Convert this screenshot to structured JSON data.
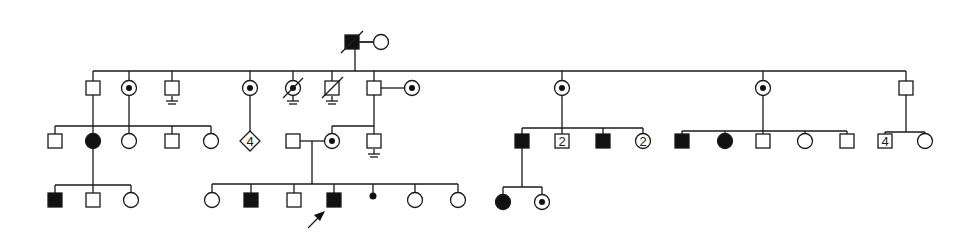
{
  "figure": {
    "type": "pedigree",
    "legend_colors": {
      "line": "#1a1a1a",
      "affected": "#111111",
      "unaffected": "#ffffff"
    },
    "proband_marker": "arrow"
  },
  "generations": [
    {
      "label": "I",
      "individuals": [
        {
          "id": "I-1",
          "sex": "male",
          "status": "affected",
          "deceased": true,
          "x": 352,
          "y": 42
        },
        {
          "id": "I-2",
          "sex": "female",
          "status": "unaffected",
          "x": 381,
          "y": 42
        }
      ]
    },
    {
      "label": "II",
      "individuals": [
        {
          "id": "II-1",
          "sex": "male",
          "status": "unaffected",
          "x": 93,
          "y": 88
        },
        {
          "id": "II-2",
          "sex": "female",
          "status": "carrier",
          "x": 129,
          "y": 88
        },
        {
          "id": "II-3",
          "sex": "male",
          "status": "unaffected",
          "no_offspring": true,
          "x": 172,
          "y": 88
        },
        {
          "id": "II-4",
          "sex": "female",
          "status": "carrier",
          "x": 250,
          "y": 88
        },
        {
          "id": "II-5",
          "sex": "female",
          "status": "carrier",
          "deceased": true,
          "no_offspring": true,
          "x": 293,
          "y": 88
        },
        {
          "id": "II-6",
          "sex": "male",
          "status": "unaffected",
          "deceased": true,
          "no_offspring": true,
          "x": 332,
          "y": 88
        },
        {
          "id": "II-7",
          "sex": "male",
          "status": "unaffected",
          "x": 374,
          "y": 88
        },
        {
          "id": "II-7s",
          "sex": "female",
          "status": "carrier",
          "spouse_of": "II-7",
          "x": 412,
          "y": 88
        },
        {
          "id": "II-8",
          "sex": "female",
          "status": "carrier",
          "x": 562,
          "y": 88
        },
        {
          "id": "II-9",
          "sex": "female",
          "status": "carrier",
          "x": 763,
          "y": 88
        },
        {
          "id": "II-10",
          "sex": "male",
          "status": "unaffected",
          "x": 906,
          "y": 88
        }
      ]
    },
    {
      "label": "III",
      "individuals": [
        {
          "id": "III-1",
          "sex": "male",
          "status": "unaffected",
          "x": 55,
          "y": 141
        },
        {
          "id": "III-2",
          "sex": "female",
          "status": "affected",
          "x": 93,
          "y": 141
        },
        {
          "id": "III-3",
          "sex": "female",
          "status": "unaffected",
          "x": 129,
          "y": 141
        },
        {
          "id": "III-4",
          "sex": "male",
          "status": "unaffected",
          "x": 172,
          "y": 141
        },
        {
          "id": "III-5",
          "sex": "female",
          "status": "unaffected",
          "x": 211,
          "y": 141
        },
        {
          "id": "III-6",
          "sex": "unknown",
          "status": "unaffected",
          "count": "4",
          "x": 250,
          "y": 141
        },
        {
          "id": "III-7s",
          "sex": "male",
          "status": "unaffected",
          "spouse_of": "III-7",
          "x": 293,
          "y": 141
        },
        {
          "id": "III-7",
          "sex": "female",
          "status": "carrier",
          "x": 332,
          "y": 141
        },
        {
          "id": "III-8",
          "sex": "male",
          "status": "unaffected",
          "no_offspring": true,
          "x": 374,
          "y": 141
        },
        {
          "id": "III-9",
          "sex": "male",
          "status": "affected",
          "x": 522,
          "y": 141
        },
        {
          "id": "III-10",
          "sex": "male",
          "status": "unaffected",
          "count": "2",
          "x": 562,
          "y": 141
        },
        {
          "id": "III-11",
          "sex": "male",
          "status": "affected",
          "x": 603,
          "y": 141
        },
        {
          "id": "III-12",
          "sex": "female",
          "status": "unaffected",
          "count": "2",
          "x": 643,
          "y": 141
        },
        {
          "id": "III-13",
          "sex": "male",
          "status": "affected",
          "x": 682,
          "y": 141
        },
        {
          "id": "III-14",
          "sex": "female",
          "status": "affected",
          "x": 725,
          "y": 141
        },
        {
          "id": "III-15",
          "sex": "male",
          "status": "unaffected",
          "x": 763,
          "y": 141
        },
        {
          "id": "III-16",
          "sex": "female",
          "status": "unaffected",
          "x": 805,
          "y": 141
        },
        {
          "id": "III-17",
          "sex": "male",
          "status": "unaffected",
          "x": 847,
          "y": 141
        },
        {
          "id": "III-18",
          "sex": "male",
          "status": "unaffected",
          "count": "4",
          "x": 885,
          "y": 141
        },
        {
          "id": "III-19",
          "sex": "female",
          "status": "unaffected",
          "x": 925,
          "y": 141
        }
      ]
    },
    {
      "label": "IV",
      "individuals": [
        {
          "id": "IV-1",
          "sex": "male",
          "status": "affected",
          "x": 55,
          "y": 200
        },
        {
          "id": "IV-2",
          "sex": "male",
          "status": "unaffected",
          "x": 93,
          "y": 200
        },
        {
          "id": "IV-3",
          "sex": "female",
          "status": "unaffected",
          "x": 131,
          "y": 200
        },
        {
          "id": "IV-4",
          "sex": "female",
          "status": "unaffected",
          "x": 212,
          "y": 200
        },
        {
          "id": "IV-5",
          "sex": "male",
          "status": "affected",
          "x": 251,
          "y": 200
        },
        {
          "id": "IV-6",
          "sex": "male",
          "status": "unaffected",
          "x": 294,
          "y": 200
        },
        {
          "id": "IV-7",
          "sex": "male",
          "status": "affected",
          "proband": true,
          "x": 334,
          "y": 200
        },
        {
          "id": "IV-8",
          "sex": "unknown",
          "status": "miscarriage",
          "x": 373,
          "y": 196
        },
        {
          "id": "IV-9",
          "sex": "female",
          "status": "unaffected",
          "x": 415,
          "y": 200
        },
        {
          "id": "IV-10",
          "sex": "female",
          "status": "unaffected",
          "x": 458,
          "y": 200
        },
        {
          "id": "IV-11",
          "sex": "female",
          "status": "affected",
          "x": 503,
          "y": 202
        },
        {
          "id": "IV-12",
          "sex": "female",
          "status": "carrier",
          "x": 542,
          "y": 202
        }
      ]
    }
  ],
  "labels": {
    "III-6": "4",
    "III-10": "2",
    "III-12": "2",
    "III-18": "4"
  }
}
